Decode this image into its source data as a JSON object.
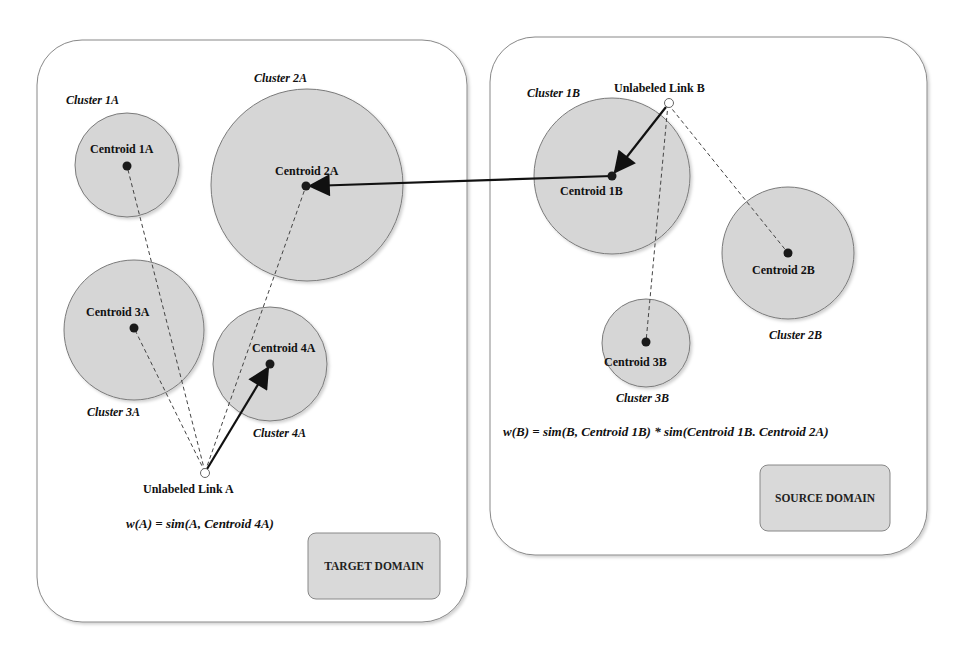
{
  "colors": {
    "cluster_fill": "#d6d6d6",
    "cluster_stroke": "#7a7a7a",
    "domain_box_stroke": "#888888",
    "domain_label_fill": "#d9d9d9",
    "centroid": "#1a1a1a",
    "arrow": "#111111",
    "dashed": "#444444"
  },
  "target_domain": {
    "label": "TARGET DOMAIN",
    "formula": "w(A) = sim(A, Centroid 4A)",
    "unlabeled_link": "Unlabeled Link A",
    "clusters": [
      {
        "name": "Cluster 1A",
        "centroid": "Centroid 1A"
      },
      {
        "name": "Cluster 2A",
        "centroid": "Centroid 2A"
      },
      {
        "name": "Cluster 3A",
        "centroid": "Centroid 3A"
      },
      {
        "name": "Cluster 4A",
        "centroid": "Centroid 4A"
      }
    ]
  },
  "source_domain": {
    "label": "SOURCE DOMAIN",
    "formula": "w(B) = sim(B, Centroid 1B) * sim(Centroid 1B. Centroid 2A)",
    "unlabeled_link": "Unlabeled Link B",
    "clusters": [
      {
        "name": "Cluster 1B",
        "centroid": "Centroid 1B"
      },
      {
        "name": "Cluster 2B",
        "centroid": "Centroid 2B"
      },
      {
        "name": "Cluster 3B",
        "centroid": "Centroid 3B"
      }
    ]
  }
}
